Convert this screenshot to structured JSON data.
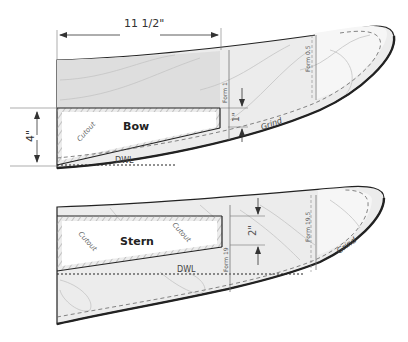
{
  "colors": {
    "outline": "#222222",
    "fill_light": "#ececec",
    "fill_mid": "#dedede",
    "tip_fill": "#f6f6f6",
    "hatch": "#9a9a9a",
    "grain": "#c4c4c4",
    "guide": "#777777"
  },
  "dimensions": {
    "width_label": "11 1/2\"",
    "height_label": "4\"",
    "bow_offset_label": "1\"",
    "stern_offset_label": "2\""
  },
  "bow": {
    "name": "Bow",
    "cutout_label": "Cutout",
    "waterline_label": "DWL",
    "grind_label": "Grind",
    "form_a": "Form 1",
    "form_b": "Form 0.5"
  },
  "stern": {
    "name": "Stern",
    "cutout_label_left": "Cutout",
    "cutout_label_right": "Cutout",
    "waterline_label": "DWL",
    "grind_label": "Grind",
    "form_a": "Form 19",
    "form_b": "Form 19.5"
  }
}
